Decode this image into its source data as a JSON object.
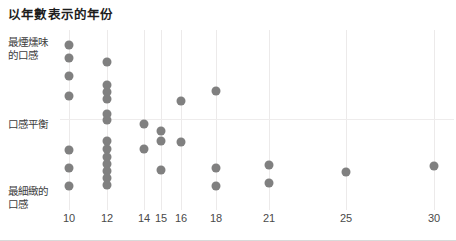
{
  "chart_data": {
    "type": "scatter",
    "title": "以年數表示的年份",
    "xlabel": "",
    "ylabel": "",
    "grid": "vertical-and-one-horizontal",
    "legend": "none",
    "xlim": [
      9,
      31
    ],
    "x_ticks": [
      {
        "label": "10",
        "value": 10,
        "px": 69
      },
      {
        "label": "12",
        "value": 12,
        "px": 107
      },
      {
        "label": "14",
        "value": 14,
        "px": 144
      },
      {
        "label": "15",
        "value": 15,
        "px": 161
      },
      {
        "label": "16",
        "value": 16,
        "px": 181
      },
      {
        "label": "18",
        "value": 18,
        "px": 216
      },
      {
        "label": "21",
        "value": 21,
        "px": 269
      },
      {
        "label": "25",
        "value": 25,
        "px": 346
      },
      {
        "label": "30",
        "value": 30,
        "px": 434
      }
    ],
    "y_ticks": [
      {
        "label": "最煙燻味\n的口感",
        "line1": "最煙燻味",
        "line2": "的口感",
        "px": 36,
        "position": "top"
      },
      {
        "label": "口感平衡",
        "line1": "口感平衡",
        "line2": "",
        "px": 118,
        "position": "middle"
      },
      {
        "label": "最細緻的\n口感",
        "line1": "最細緻的",
        "line2": "口感",
        "px": 185,
        "position": "bottom"
      }
    ],
    "gridlines_y_px": [
      119
    ],
    "series": [
      {
        "name": "whiskies",
        "color": "#808080",
        "points": [
          {
            "x": 10,
            "px": 69,
            "py": 45
          },
          {
            "x": 10,
            "px": 69,
            "py": 58
          },
          {
            "x": 10,
            "px": 69,
            "py": 76
          },
          {
            "x": 10,
            "px": 69,
            "py": 96
          },
          {
            "x": 10,
            "px": 69,
            "py": 150
          },
          {
            "x": 10,
            "px": 69,
            "py": 168
          },
          {
            "x": 10,
            "px": 69,
            "py": 186
          },
          {
            "x": 12,
            "px": 107,
            "py": 62
          },
          {
            "x": 12,
            "px": 107,
            "py": 85
          },
          {
            "x": 12,
            "px": 107,
            "py": 92
          },
          {
            "x": 12,
            "px": 107,
            "py": 99
          },
          {
            "x": 12,
            "px": 107,
            "py": 114
          },
          {
            "x": 12,
            "px": 107,
            "py": 120
          },
          {
            "x": 12,
            "px": 107,
            "py": 141
          },
          {
            "x": 12,
            "px": 107,
            "py": 149
          },
          {
            "x": 12,
            "px": 107,
            "py": 157
          },
          {
            "x": 12,
            "px": 107,
            "py": 164
          },
          {
            "x": 12,
            "px": 107,
            "py": 171
          },
          {
            "x": 12,
            "px": 107,
            "py": 178
          },
          {
            "x": 12,
            "px": 107,
            "py": 185
          },
          {
            "x": 14,
            "px": 144,
            "py": 124
          },
          {
            "x": 14,
            "px": 144,
            "py": 149
          },
          {
            "x": 15,
            "px": 161,
            "py": 131
          },
          {
            "x": 15,
            "px": 161,
            "py": 141
          },
          {
            "x": 15,
            "px": 161,
            "py": 170
          },
          {
            "x": 16,
            "px": 181,
            "py": 101
          },
          {
            "x": 16,
            "px": 181,
            "py": 142
          },
          {
            "x": 18,
            "px": 216,
            "py": 91
          },
          {
            "x": 18,
            "px": 216,
            "py": 168
          },
          {
            "x": 18,
            "px": 216,
            "py": 186
          },
          {
            "x": 21,
            "px": 269,
            "py": 165
          },
          {
            "x": 21,
            "px": 269,
            "py": 183
          },
          {
            "x": 25,
            "px": 346,
            "py": 172
          },
          {
            "x": 30,
            "px": 434,
            "py": 166
          }
        ]
      }
    ]
  }
}
